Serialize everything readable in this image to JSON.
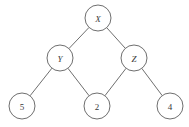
{
  "diagram": {
    "background_color": "#ffffff",
    "stroke_color": "#6f6f6f",
    "label_color": "#3a3a3a",
    "node_radius": 13,
    "nodes": [
      {
        "id": "x",
        "label": "X",
        "x": 98,
        "y": 18,
        "kind": "internal",
        "style": "italic"
      },
      {
        "id": "y",
        "label": "Y",
        "x": 60,
        "y": 58,
        "kind": "internal",
        "style": "italic"
      },
      {
        "id": "z",
        "label": "Z",
        "x": 134,
        "y": 58,
        "kind": "internal",
        "style": "italic"
      },
      {
        "id": "n5",
        "label": "5",
        "x": 22,
        "y": 106,
        "kind": "leaf",
        "style": "normal"
      },
      {
        "id": "n2",
        "label": "2",
        "x": 97,
        "y": 106,
        "kind": "leaf",
        "style": "normal"
      },
      {
        "id": "n4",
        "label": "4",
        "x": 170,
        "y": 106,
        "kind": "leaf",
        "style": "normal"
      }
    ],
    "edges": [
      {
        "id": "x-y",
        "from": "x",
        "to": "y"
      },
      {
        "id": "x-z",
        "from": "x",
        "to": "z"
      },
      {
        "id": "y-5",
        "from": "y",
        "to": "n5"
      },
      {
        "id": "y-2",
        "from": "y",
        "to": "n2"
      },
      {
        "id": "z-2",
        "from": "z",
        "to": "n2"
      },
      {
        "id": "z-4",
        "from": "z",
        "to": "n4"
      }
    ]
  }
}
